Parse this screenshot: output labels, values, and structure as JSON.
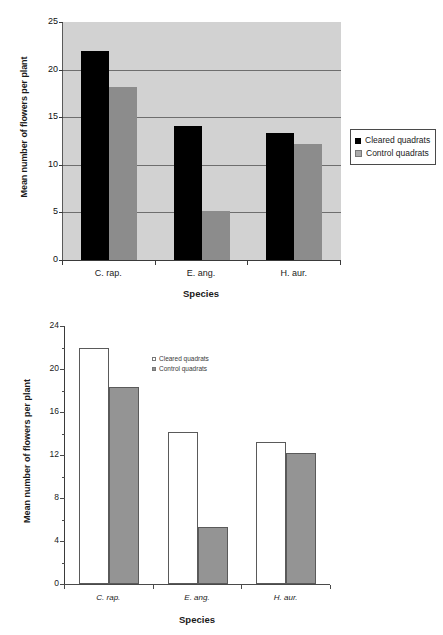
{
  "chart_data": [
    {
      "id": "top",
      "type": "bar",
      "title": "",
      "xlabel": "Species",
      "ylabel": "Mean number of flowers per plant",
      "categories": [
        "C. rap.",
        "E. ang.",
        "H. aur."
      ],
      "series": [
        {
          "name": "Cleared quadrats",
          "values": [
            22.0,
            14.1,
            13.3
          ],
          "color": "#000000"
        },
        {
          "name": "Control quadrats",
          "values": [
            18.2,
            5.2,
            12.2
          ],
          "color": "#8c8c8c"
        }
      ],
      "ylim": [
        0,
        25
      ],
      "yticks": [
        0,
        5,
        10,
        15,
        20,
        25
      ],
      "grid": true,
      "plot_background": "#d2d2d2",
      "legend_position": "right-outside",
      "legend_box": true,
      "xtick_italic": false
    },
    {
      "id": "bottom",
      "type": "bar",
      "title": "",
      "xlabel": "Species",
      "ylabel": "Mean number of flowers per plant",
      "categories": [
        "C. rap.",
        "E. ang.",
        "H. aur."
      ],
      "series": [
        {
          "name": "Cleared quadrats",
          "values": [
            22.0,
            14.1,
            13.2
          ],
          "color": "#ffffff"
        },
        {
          "name": "Control quadrats",
          "values": [
            18.3,
            5.3,
            12.2
          ],
          "color": "#949494"
        }
      ],
      "ylim": [
        0,
        24
      ],
      "yticks": [
        0,
        4,
        8,
        12,
        16,
        20,
        24
      ],
      "yminorticks": [
        2,
        6,
        10,
        14,
        18,
        22
      ],
      "grid": false,
      "plot_background": "#ffffff",
      "legend_position": "inside-upper-center",
      "legend_box": false,
      "xtick_italic": true
    }
  ]
}
